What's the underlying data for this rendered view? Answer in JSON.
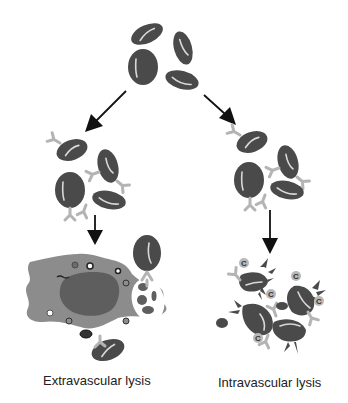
{
  "diagram": {
    "labels": {
      "extravascular": "Extravascular lysis",
      "intravascular": "Intravascular lysis"
    },
    "complement_symbol": "C",
    "colors": {
      "rbc": "#4a4a4a",
      "antibody": "#b4b4b4",
      "macrophage": "#8c8c8c",
      "nucleus": "#5e5e5e",
      "complement": "#b8b8b8",
      "arrow": "#111111"
    },
    "nodes": [
      {
        "id": "free-rbcs",
        "description": "Red blood cells"
      },
      {
        "id": "opsonized-rbcs-left",
        "description": "Antibody-coated red blood cells"
      },
      {
        "id": "opsonized-rbcs-right",
        "description": "Antibody-coated red blood cells"
      },
      {
        "id": "macrophage",
        "description": "Macrophage phagocytosing red blood cells"
      },
      {
        "id": "lysed-rbcs",
        "description": "Complement-mediated lysed red blood cells"
      }
    ],
    "edges": [
      {
        "from": "free-rbcs",
        "to": "opsonized-rbcs-left"
      },
      {
        "from": "free-rbcs",
        "to": "opsonized-rbcs-right"
      },
      {
        "from": "opsonized-rbcs-left",
        "to": "macrophage"
      },
      {
        "from": "opsonized-rbcs-right",
        "to": "lysed-rbcs"
      }
    ]
  }
}
